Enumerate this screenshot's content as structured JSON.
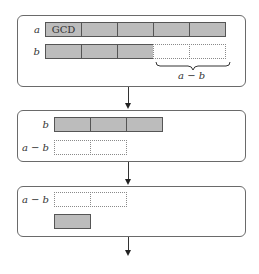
{
  "diagram": {
    "colors": {
      "filled": "#bcbcbc",
      "border": "#555555",
      "dashed": "#8a8a8a"
    },
    "step1": {
      "rows": [
        {
          "label": "a",
          "segments": [
            "GCD",
            "",
            "",
            "",
            ""
          ],
          "style": "filled"
        },
        {
          "label": "b",
          "segments": [
            "",
            "",
            ""
          ],
          "style": "filled",
          "dashed_extension": 2
        }
      ],
      "brace_label": "a − b"
    },
    "step2": {
      "rows": [
        {
          "label": "b",
          "segments": [
            "",
            "",
            ""
          ],
          "style": "filled"
        },
        {
          "label": "a − b",
          "segments": [
            "",
            ""
          ],
          "style": "dashed"
        }
      ]
    },
    "step3": {
      "rows": [
        {
          "label": "a − b",
          "segments": [
            "",
            ""
          ],
          "style": "dashed"
        },
        {
          "label": "",
          "segments": [
            ""
          ],
          "style": "filled"
        }
      ]
    }
  }
}
